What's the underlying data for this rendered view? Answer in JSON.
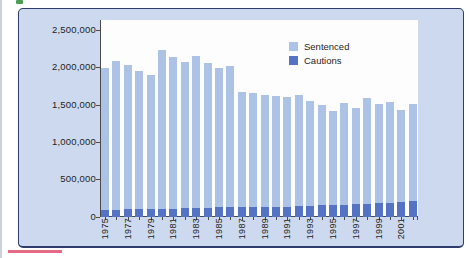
{
  "figure": {
    "caption_fragment_top": "partial-green-figure-label",
    "caption_fragment_bottom": "partial-pink-caption-rule"
  },
  "colors": {
    "panel_background": "#cdd9ee",
    "panel_border": "#2e3d6e",
    "plot_background": "#fdfdfd",
    "sentenced_bar": "#adc3e6",
    "cautions_bar": "#5473c4",
    "axis": "#4a4a4a"
  },
  "chart_data": {
    "type": "bar",
    "stacked_overlay": true,
    "title": "",
    "xlabel": "",
    "ylabel": "",
    "grid": false,
    "legend_position": "top-right-inside",
    "ylim": [
      0,
      2500000
    ],
    "y_tick_labels": [
      "2,500,000",
      "2,000,000",
      "1,500,000",
      "1,000,000",
      "500,000",
      "0"
    ],
    "x": [
      1975,
      1976,
      1977,
      1978,
      1979,
      1980,
      1981,
      1982,
      1983,
      1984,
      1985,
      1986,
      1987,
      1988,
      1989,
      1990,
      1991,
      1992,
      1993,
      1994,
      1995,
      1996,
      1997,
      1998,
      1999,
      2000,
      2001,
      2002
    ],
    "x_tick_labels": [
      "1975",
      "1977",
      "1979",
      "1981",
      "1983",
      "1985",
      "1987",
      "1989",
      "1991",
      "1993",
      "1995",
      "1997",
      "1999",
      "2001"
    ],
    "series": [
      {
        "name": "Sentenced",
        "color": "#adc3e6",
        "values": [
          2000000,
          2090000,
          2030000,
          1950000,
          1900000,
          2240000,
          2140000,
          2080000,
          2160000,
          2060000,
          2000000,
          2020000,
          1680000,
          1660000,
          1640000,
          1620000,
          1610000,
          1640000,
          1560000,
          1500000,
          1420000,
          1530000,
          1460000,
          1590000,
          1510000,
          1540000,
          1430000,
          1520000
        ]
      },
      {
        "name": "Cautions",
        "color": "#5473c4",
        "values": [
          100000,
          100000,
          105000,
          105000,
          105000,
          110000,
          110000,
          115000,
          120000,
          125000,
          130000,
          130000,
          135000,
          135000,
          130000,
          135000,
          140000,
          145000,
          150000,
          155000,
          160000,
          165000,
          175000,
          180000,
          185000,
          190000,
          200000,
          210000
        ]
      }
    ]
  }
}
